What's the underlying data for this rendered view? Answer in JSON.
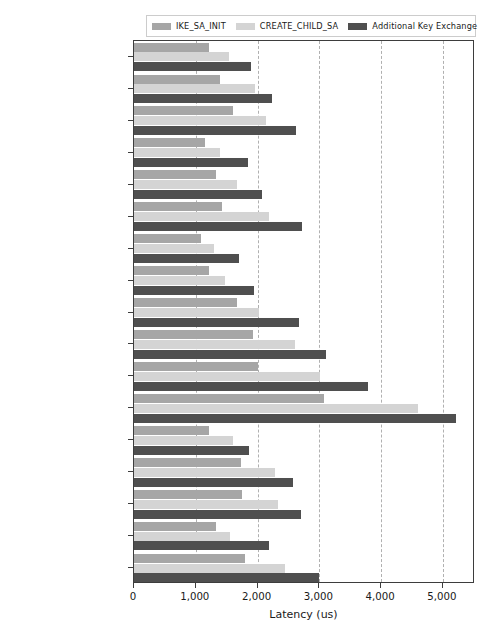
{
  "chart_data": {
    "type": "bar",
    "orientation": "horizontal",
    "title": "",
    "xlabel": "Latency (us)",
    "ylabel": "",
    "xlim": [
      0,
      5520
    ],
    "ylim": [
      0,
      17
    ],
    "grid": true,
    "grid_axis": "x",
    "legend_position": "upper center",
    "xticks": [
      0,
      1000,
      2000,
      3000,
      4000,
      5000
    ],
    "xticklabels": [
      "0",
      "1,000",
      "2,000",
      "3,000",
      "4,000",
      "5,000"
    ],
    "categories": [
      "Kyber512",
      "Kyber768",
      "Kyber1024",
      "NTRU-HPS-2048509",
      "NTRU-HPS-2048607",
      "NTRU-HPS-4096821",
      "LightSaber",
      "Saber",
      "FireSaber",
      "RLizard-category1",
      "RLizard-category3",
      "RLizard-category5",
      "LAC-128",
      "LAC-196",
      "LAC-256",
      "AKCN-MLWE",
      "AKCN-SEC"
    ],
    "series": [
      {
        "name": "IKE_SA_INIT",
        "color": "#a6a6a6",
        "values": [
          1210,
          1400,
          1600,
          1150,
          1320,
          1430,
          1080,
          1220,
          1660,
          1920,
          2010,
          3070,
          1210,
          1740,
          1750,
          1330,
          1790
        ]
      },
      {
        "name": "CREATE_CHILD_SA",
        "color": "#d4d4d4",
        "values": [
          1530,
          1960,
          2130,
          1400,
          1660,
          2180,
          1290,
          1470,
          2020,
          2610,
          3010,
          4590,
          1600,
          2290,
          2330,
          1550,
          2440
        ]
      },
      {
        "name": "Additional Key Exchange",
        "color": "#4f4f4f",
        "values": [
          1890,
          2230,
          2630,
          1850,
          2080,
          2720,
          1700,
          1950,
          2670,
          3110,
          3790,
          5220,
          1860,
          2580,
          2700,
          2190,
          3000
        ]
      }
    ]
  },
  "legend": {
    "entries": [
      {
        "label": "IKE_SA_INIT",
        "color": "#a6a6a6"
      },
      {
        "label": "CREATE_CHILD_SA",
        "color": "#d4d4d4"
      },
      {
        "label": "Additional Key Exchange",
        "color": "#4f4f4f"
      }
    ]
  },
  "axis": {
    "x_title": "Latency (us)"
  }
}
